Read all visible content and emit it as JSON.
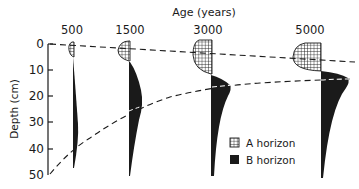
{
  "title": "Age (years)",
  "y_axis": {
    "label": "Depth (cm)",
    "ticks": [
      "0",
      "10",
      "20",
      "30",
      "40",
      "50"
    ]
  },
  "legend": [
    {
      "key": "A",
      "label": "A horizon",
      "pattern": "grid-hatch"
    },
    {
      "key": "B",
      "label": "B horizon",
      "pattern": "solid-black"
    }
  ],
  "colors": {
    "ink": "#1a1a1a",
    "background": "#ffffff"
  },
  "profiles": [
    {
      "age": "500",
      "a_horizon_depth_cm": [
        0,
        5
      ],
      "b_horizon_depth_cm": [
        5,
        47
      ],
      "b_max_depth_cm": 36
    },
    {
      "age": "1500",
      "a_horizon_depth_cm": [
        -2,
        7
      ],
      "b_horizon_depth_cm": [
        7,
        48
      ],
      "b_max_depth_cm": 24
    },
    {
      "age": "3000",
      "a_horizon_depth_cm": [
        -4,
        12
      ],
      "b_horizon_depth_cm": [
        12,
        48
      ],
      "b_max_depth_cm": 17
    },
    {
      "age": "5000",
      "a_horizon_depth_cm": [
        -4,
        12
      ],
      "b_horizon_depth_cm": [
        12,
        48
      ],
      "b_max_depth_cm": 13
    }
  ],
  "boundaries": [
    {
      "name": "A-B boundary",
      "style": "dashed"
    },
    {
      "name": "B lower boundary (max clay)",
      "style": "dashed"
    }
  ]
}
